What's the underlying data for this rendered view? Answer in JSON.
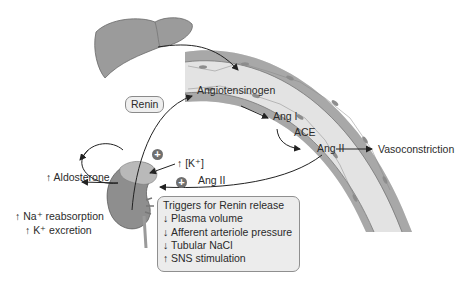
{
  "diagram": {
    "organs": {
      "liver": "liver-illustration",
      "vessel": "blood-vessel-illustration",
      "kidney": "kidney-adrenal-illustration"
    },
    "labels": {
      "renin": "Renin",
      "angiotensinogen": "Angiotensinogen",
      "ang1": "Ang I",
      "ace": "ACE",
      "ang2_vessel": "Ang II",
      "vasoconstriction": "Vasoconstriction",
      "aldosterone": "↑ Aldosterone",
      "k_conc": "↑ [K⁺]",
      "ang2_feedback": "Ang II",
      "na_reabsorption": "↑ Na⁺ reabsorption",
      "k_excretion": "↑ K⁺ excretion",
      "plus_symbol": "+"
    },
    "triggers": {
      "title": "Triggers for Renin release",
      "items": [
        {
          "arrow": "↓",
          "text": "Plasma volume"
        },
        {
          "arrow": "↓",
          "text": "Afferent arteriole pressure"
        },
        {
          "arrow": "↓",
          "text": "Tubular NaCl"
        },
        {
          "arrow": "↑",
          "text": "SNS stimulation"
        }
      ]
    },
    "colors": {
      "vessel_wall": "#a9a9a9",
      "vessel_lumen": "#e2e2e2",
      "organ_gray": "#9a9a9a",
      "box_fill": "#ececec",
      "text": "#2b2b2b"
    }
  }
}
